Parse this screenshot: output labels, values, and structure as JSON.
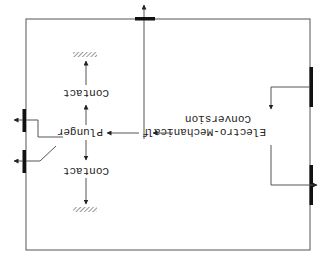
{
  "diagram": {
    "orientation": "rotated-180",
    "labels": {
      "conversion_line1": "Electro-Mechanical",
      "conversion_line2": "Conversion",
      "force": "f",
      "plunger": "Plunger",
      "contact_upper": "Contact",
      "contact_lower": "Contact"
    },
    "colors": {
      "line": "#555555",
      "terminal": "#111111",
      "background": "#ffffff"
    },
    "nodes": [
      {
        "id": "conversion",
        "label": "Electro-Mechanical Conversion"
      },
      {
        "id": "force",
        "label": "f"
      },
      {
        "id": "plunger",
        "label": "Plunger"
      },
      {
        "id": "contact-1",
        "label": "Contact"
      },
      {
        "id": "contact-2",
        "label": "Contact"
      },
      {
        "id": "ground-1",
        "label": ""
      },
      {
        "id": "ground-2",
        "label": ""
      }
    ],
    "edges": [
      {
        "from": "conversion",
        "to": "force"
      },
      {
        "from": "force",
        "to": "plunger"
      },
      {
        "from": "plunger",
        "to": "contact-1"
      },
      {
        "from": "plunger",
        "to": "contact-2"
      },
      {
        "from": "contact-1",
        "to": "ground-1"
      },
      {
        "from": "contact-2",
        "to": "ground-2"
      }
    ]
  }
}
